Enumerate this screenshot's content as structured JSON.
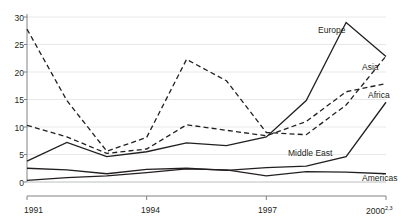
{
  "chart_data": {
    "type": "line",
    "title": "",
    "subtitle": "",
    "xlabel": "",
    "ylabel": "",
    "x": [
      1991,
      1992,
      1993,
      1994,
      1995,
      1996,
      1997,
      1998,
      1999,
      2000
    ],
    "xlim": [
      1991,
      2000
    ],
    "ylim": [
      0,
      30
    ],
    "yticks": [
      0,
      5,
      10,
      15,
      20,
      25,
      30
    ],
    "xticks": [
      1991,
      1994,
      1997,
      2000
    ],
    "xtick_labels": [
      "1991",
      "1994",
      "1997",
      "2000"
    ],
    "ytick_labels": [
      "0",
      "5",
      "10",
      "15",
      "20",
      "25",
      "30"
    ],
    "xtick_superscripts": [
      "",
      "",
      "",
      "2,3"
    ],
    "grid": "horizontal",
    "legend": "inline-annotations",
    "series": [
      {
        "name": "Europe",
        "style": "solid",
        "color": "#231f20",
        "label_x": 1997.45,
        "label_y": 27.1,
        "values": [
          3.8,
          7.2,
          4.6,
          5.5,
          7.1,
          6.6,
          8.2,
          14.8,
          29.0,
          22.8
        ]
      },
      {
        "name": "Asia",
        "style": "dashed",
        "color": "#231f20",
        "label_x": 1998.6,
        "label_y": 21.3,
        "values": [
          27.8,
          14.8,
          5.6,
          8.1,
          22.3,
          18.4,
          9.0,
          8.6,
          14.0,
          22.9
        ]
      },
      {
        "name": "Africa",
        "style": "dashed",
        "color": "#231f20",
        "label_x": 1998.75,
        "label_y": 16.6,
        "values": [
          10.3,
          8.2,
          5.2,
          6.0,
          10.4,
          9.4,
          8.4,
          11.0,
          16.4,
          17.9
        ]
      },
      {
        "name": "Middle East",
        "style": "solid",
        "color": "#231f20",
        "label_x": 1997.1,
        "label_y": 5.3,
        "values": [
          2.5,
          2.2,
          1.5,
          2.3,
          2.5,
          2.1,
          2.6,
          2.9,
          4.6,
          14.5
        ]
      },
      {
        "name": "Americas",
        "style": "solid",
        "color": "#231f20",
        "label_x": 1998.85,
        "label_y": 2.6,
        "values": [
          0.3,
          0.8,
          1.1,
          1.7,
          2.4,
          2.2,
          1.1,
          1.9,
          1.8,
          1.5
        ]
      }
    ]
  },
  "style": {
    "axis_color": "#808285",
    "grid_color": "#e8e8e8",
    "line_color": "#231f20",
    "text_color": "#231f20",
    "background": "#ffffff"
  }
}
